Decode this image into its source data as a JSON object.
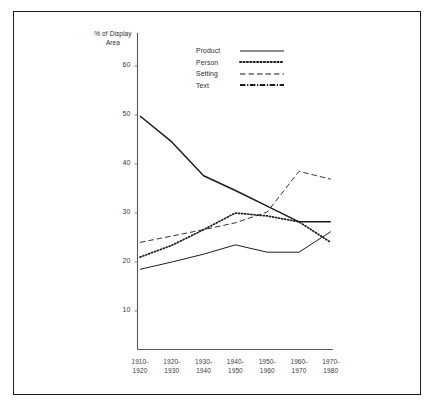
{
  "chart_data": {
    "type": "line",
    "title": "",
    "xlabel": "",
    "ylabel": "% of Display\nArea",
    "ylim": [
      0,
      65
    ],
    "yticks": [
      10,
      20,
      30,
      40,
      50,
      60
    ],
    "grid": false,
    "legend_position": "top-right",
    "categories": [
      "1910-\n1920",
      "1920-\n1930",
      "1930-\n1940",
      "1940-\n1950",
      "1950-\n1960",
      "1960-\n1970",
      "1970-\n1980"
    ],
    "series": [
      {
        "name": "Product",
        "style": "solid",
        "color": "#1d1d1f",
        "values": [
          18.5,
          20.0,
          21.6,
          23.5,
          22.0,
          22.0,
          26.2
        ]
      },
      {
        "name": "Person",
        "style": "dotted",
        "color": "#1d1d1f",
        "values": [
          21.0,
          23.4,
          26.6,
          30.0,
          29.4,
          28.2,
          24.0
        ]
      },
      {
        "name": "Setting",
        "style": "dashed",
        "color": "#1d1d1f",
        "values": [
          24.0,
          25.3,
          26.6,
          28.0,
          30.2,
          38.5,
          36.9
        ]
      },
      {
        "name": "Text",
        "style": "dash-dot",
        "color": "#1d1d1f",
        "values": [
          49.8,
          44.5,
          37.6,
          34.6,
          31.4,
          28.2,
          28.2
        ]
      }
    ]
  },
  "legend": {
    "items": [
      {
        "label": "Product",
        "swatch": "solid-line-swatch"
      },
      {
        "label": "Person",
        "swatch": "dotted-line-swatch"
      },
      {
        "label": "Setting",
        "swatch": "dashed-line-swatch"
      },
      {
        "label": "Text",
        "swatch": "dash-dot-line-swatch"
      }
    ]
  }
}
